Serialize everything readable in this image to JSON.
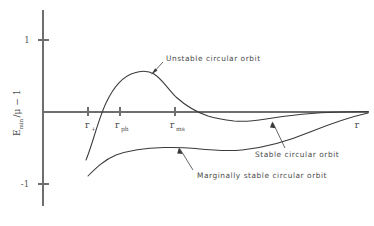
{
  "chart_data": {
    "type": "line",
    "title": "",
    "xlabel": "r",
    "ylabel": "E_min/μ − 1",
    "ylim": [
      -1.35,
      1.35
    ],
    "xlim": [
      0,
      1
    ],
    "grid": false,
    "legend_position": "inline-annotations",
    "y_ticks": [
      {
        "value": 1,
        "label": "1"
      },
      {
        "value": -1,
        "label": "-1"
      }
    ],
    "x_ticks": [
      {
        "label": "r",
        "sub": "+",
        "x": 88
      },
      {
        "label": "r",
        "sub": "ph",
        "x": 120
      },
      {
        "label": "r",
        "sub": "ms",
        "x": 175
      }
    ],
    "series": [
      {
        "name": "Unstable circular orbit",
        "description": "Rises steeply from below the axis near r_+, crosses zero at r_ph, peaks above the axis, then falls, crossing zero again and dipping slightly negative before asymptotically approaching zero from below at large r.",
        "path": "M 86,160 C 92,146 98,120 106,103 C 114,86 124,76 134,73 C 143,70 149,71 154,74 C 162,79 168,89 176,97 C 186,106 196,112 208,116 C 218,119 226,120 234,121 C 244,122 254,121 266,119 C 284,116 306,113 340,112 L 368,111.5"
      },
      {
        "name": "Marginally stable circular orbit",
        "description": "Starts low at the left, rises with a gentle slope to a broad shallow maximum, then slowly climbs toward the axis at large r.",
        "path": "M 88,176 C 96,168 104,160 116,155 C 130,150 148,148 164,147.5 C 176,147.2 186,147.6 196,148.6 C 210,150 224,151.5 242,150 C 262,148 286,142 310,132 C 330,124 350,117 368,113"
      },
      {
        "name": "Stable circular orbit",
        "description": "Lower branch of the upper curve after the minimum; converges toward zero from below at large r.",
        "path": ""
      }
    ],
    "annotations": [
      {
        "id": "unstable",
        "text": "Unstable circular orbit",
        "text_x": 165,
        "text_y": 60,
        "point_x": 152,
        "point_y": 73
      },
      {
        "id": "stable",
        "text": "Stable circular orbit",
        "text_x": 253,
        "text_y": 155,
        "point_x": 272,
        "point_y": 122
      },
      {
        "id": "marginally-stable",
        "text": "Marginally stable circular orbit",
        "text_x": 196,
        "text_y": 176,
        "point_x": 179,
        "point_y": 147
      }
    ],
    "axis_geometry": {
      "y_axis_x": 43,
      "y_axis_top": 10,
      "y_axis_bottom": 206,
      "x_axis_y": 112,
      "x_axis_left": 43,
      "x_axis_right": 369,
      "tick_y_plus1": 40,
      "tick_y_minus1": 184
    },
    "colors": {
      "curve": "#3a3a3a",
      "axis": "#6e6e6e",
      "text": "#4a4a4a",
      "background": "#ffffff"
    }
  }
}
